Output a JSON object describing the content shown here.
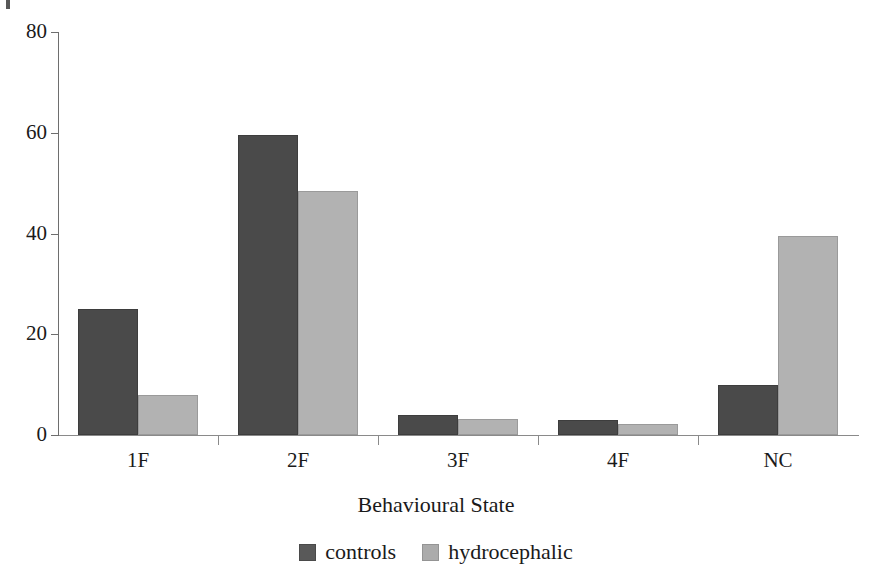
{
  "chart_data": {
    "type": "bar",
    "title": "",
    "subtitle": "",
    "xlabel": "Behavioural State",
    "ylabel": "",
    "categories": [
      "1F",
      "2F",
      "3F",
      "4F",
      "NC"
    ],
    "ylim": [
      0,
      80
    ],
    "yticks": [
      0,
      20,
      40,
      60,
      80
    ],
    "ytick_labels": [
      "0",
      "20",
      "40",
      "60",
      "80"
    ],
    "grid": false,
    "legend_position": "bottom-center",
    "series": [
      {
        "name": "controls",
        "color": "#4a4a4a",
        "values": [
          25,
          59.5,
          4,
          3,
          10
        ]
      },
      {
        "name": "hydrocephalic",
        "color": "#b2b2b2",
        "values": [
          8,
          48.5,
          3.2,
          2.2,
          39.5
        ]
      }
    ],
    "annotations": []
  },
  "legend": {
    "items": [
      {
        "label": "controls",
        "swatch": "controls-swatch"
      },
      {
        "label": "hydrocephalic",
        "swatch": "hydrocephalic-swatch"
      }
    ]
  },
  "axis": {
    "x_title": "Behavioural State"
  },
  "colors": {
    "controls": "#4a4a4a",
    "hydrocephalic": "#b2b2b2",
    "axis": "#6e6e6e",
    "text": "#1a1a1a",
    "background": "#ffffff"
  }
}
